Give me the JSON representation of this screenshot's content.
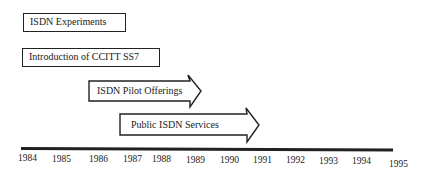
{
  "title": "",
  "timeline": {
    "years": [
      "1984",
      "1985",
      "1986",
      "1987",
      "1988",
      "1989",
      "1990",
      "1991",
      "1992",
      "1993",
      "1994",
      "1995"
    ]
  },
  "events": [
    {
      "label": "ISDN Experiments",
      "shape": "box"
    },
    {
      "label": "Introduction of CCITT SS7",
      "shape": "box"
    },
    {
      "label": "ISDN Pilot Offerings",
      "shape": "arrow"
    },
    {
      "label": "Public ISDN Services",
      "shape": "arrow"
    }
  ],
  "colors": {
    "stroke": "#222222",
    "background": "#ffffff",
    "text": "#1a1a1a"
  }
}
